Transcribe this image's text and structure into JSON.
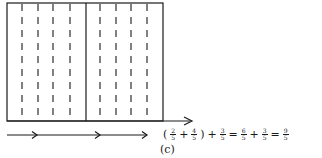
{
  "figure": {
    "label": "(c)",
    "rectangle": {
      "units_total": 10,
      "solid_divider_after": 5,
      "dashed_lines": 8
    },
    "arrows": [
      {
        "from": 0,
        "to": 2,
        "description": "2/5"
      },
      {
        "from": 2,
        "to": 6,
        "description": "4/5"
      },
      {
        "from": 6,
        "to": 9,
        "description": "3/5"
      }
    ]
  },
  "equation": {
    "open_paren": "(",
    "f1": {
      "num": "2",
      "den": "5"
    },
    "plus1": "+",
    "f2": {
      "num": "4",
      "den": "5"
    },
    "close_paren": ")",
    "plus2": "+",
    "f3": {
      "num": "3",
      "den": "5"
    },
    "eq1": "=",
    "f4": {
      "num": "6",
      "den": "5"
    },
    "plus3": "+",
    "f5": {
      "num": "3",
      "den": "5"
    },
    "eq2": "=",
    "f6": {
      "num": "9",
      "den": "5"
    }
  }
}
